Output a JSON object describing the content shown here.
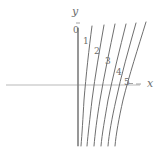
{
  "figure": {
    "background_color": "#ffffff",
    "width": 166,
    "height": 147
  },
  "axes": {
    "x_axis": {
      "label": "x",
      "label_x": 148,
      "label_y": 79,
      "color": "#b9b9b9",
      "y_pixel": 85,
      "x_start": 6,
      "x_end": 140
    },
    "y_axis": {
      "label": "y",
      "label_x": 72,
      "label_y": 9,
      "color": "#8c8c8c",
      "x_pixel": 78,
      "y_start": 28,
      "y_end": 145
    },
    "origin_tick": {
      "label": "0",
      "label_x": 74,
      "label_y": 27
    }
  },
  "curves": {
    "color": "#6f6f6f",
    "stroke_width": 1,
    "items": [
      {
        "label": "0",
        "label_x": 74,
        "label_y": 27,
        "path": "M 78,28 L 78,146"
      },
      {
        "label": "1",
        "label_x": 84,
        "label_y": 38,
        "path": "M 92,26 C 89,48 86,76 84,100 C 83,118 82,134 81,146"
      },
      {
        "label": "2",
        "label_x": 95,
        "label_y": 48,
        "path": "M 104,25 C 100,48 95,76 92,100 C 90,118 88,134 87,146"
      },
      {
        "label": "3",
        "label_x": 106,
        "label_y": 58,
        "path": "M 115,24 C 110,48 104,76 100,100 C 97,118 95,134 94,146"
      },
      {
        "label": "4",
        "label_x": 117,
        "label_y": 69,
        "path": "M 126,24 C 120,48 113,76 108,100 C 105,118 102,134 101,146"
      },
      {
        "label": "5",
        "label_x": 124,
        "label_y": 80,
        "path": "M 136,23 C 129,48 121,76 116,100 C 112,118 109,134 108,146"
      },
      {
        "label": "",
        "label_x": 0,
        "label_y": 0,
        "path": "M 146,22 C 138,48 129,76 123,100 C 119,118 116,134 115,146"
      }
    ]
  },
  "ticks": {
    "color": "#8c8c8c",
    "marks": [
      {
        "x1": 76,
        "y1": 23,
        "x2": 80,
        "y2": 23
      },
      {
        "x1": 129,
        "y1": 83,
        "x2": 134,
        "y2": 83
      },
      {
        "x1": 136,
        "y1": 84,
        "x2": 141,
        "y2": 84
      }
    ]
  }
}
